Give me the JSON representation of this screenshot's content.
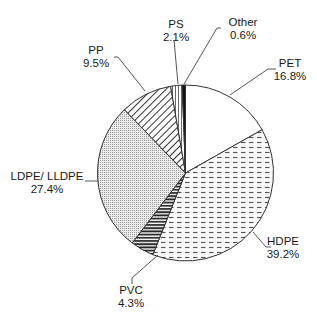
{
  "chart_data": {
    "type": "pie",
    "title": "",
    "start_angle_deg": 0,
    "direction": "clockwise",
    "slices": [
      {
        "label": "PET",
        "value": 16.8,
        "value_label": "16.8%",
        "pattern": "blank"
      },
      {
        "label": "HDPE",
        "value": 39.2,
        "value_label": "39.2%",
        "pattern": "dashes"
      },
      {
        "label": "PVC",
        "value": 4.3,
        "value_label": "4.3%",
        "pattern": "horizontal-stripes-dense"
      },
      {
        "label": "LDPE/ LLDPE",
        "value": 27.4,
        "value_label": "27.4%",
        "pattern": "dotted-grid"
      },
      {
        "label": "PP",
        "value": 9.5,
        "value_label": "9.5%",
        "pattern": "diagonal-stripes"
      },
      {
        "label": "PS",
        "value": 2.1,
        "value_label": "2.1%",
        "pattern": "vertical-lines"
      },
      {
        "label": "Other",
        "value": 0.6,
        "value_label": "0.6%",
        "pattern": "solid-black"
      }
    ],
    "categories": [
      "PET",
      "HDPE",
      "PVC",
      "LDPE/ LLDPE",
      "PP",
      "PS",
      "Other"
    ],
    "values": [
      16.8,
      39.2,
      4.3,
      27.4,
      9.5,
      2.1,
      0.6
    ],
    "legend": "none (callout labels with leader lines)",
    "colors": {
      "stroke": "#333333",
      "fill": "#ffffff",
      "pattern": "#555555",
      "solid": "#111111"
    }
  },
  "labels": {
    "pet": {
      "name": "PET",
      "pct": "16.8%"
    },
    "hdpe": {
      "name": "HDPE",
      "pct": "39.2%"
    },
    "pvc": {
      "name": "PVC",
      "pct": "4.3%"
    },
    "ldpe": {
      "name": "LDPE/ LLDPE",
      "pct": "27.4%"
    },
    "pp": {
      "name": "PP",
      "pct": "9.5%"
    },
    "ps": {
      "name": "PS",
      "pct": "2.1%"
    },
    "other": {
      "name": "Other",
      "pct": "0.6%"
    }
  }
}
